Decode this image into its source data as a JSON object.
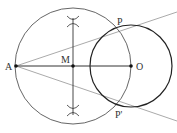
{
  "diagram": {
    "type": "geometry-construction",
    "colors": {
      "circle_stroke": "#444444",
      "small_circle_stroke": "#222222",
      "segment_stroke": "#333333",
      "tangent_stroke": "#aaaaaa",
      "label": "#333333",
      "point": "#111111"
    },
    "points": {
      "A": {
        "label": "A",
        "x": 16,
        "y": 66
      },
      "M": {
        "label": "M",
        "x": 73,
        "y": 66
      },
      "O": {
        "label": "O",
        "x": 131,
        "y": 66
      },
      "P": {
        "label": "P",
        "x": 117,
        "y": 28
      },
      "P_prime": {
        "label": "P'",
        "x": 117,
        "y": 105
      }
    },
    "circles": [
      {
        "name": "circle-AO-diameter",
        "center": "M",
        "radius": 58
      },
      {
        "name": "circle-O",
        "center": "O",
        "radius": 41
      }
    ]
  }
}
